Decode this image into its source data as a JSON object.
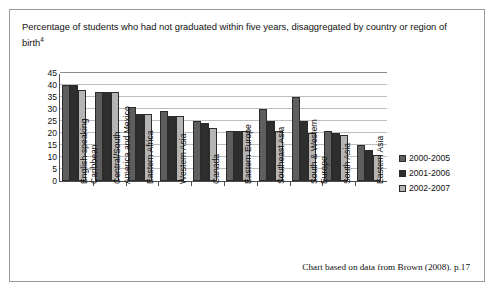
{
  "chart": {
    "title_text": "Percentage of students who had not graduated within five years, disaggregated by country or region of birth",
    "title_superscript": "4",
    "footer": "Chart based on data from Brown (2008). p.17"
  },
  "chart_data": {
    "type": "bar",
    "title": "Percentage of students who had not graduated within five years, disaggregated by country or region of birth",
    "xlabel": "",
    "ylabel": "",
    "ylim": [
      0,
      45
    ],
    "yticks": [
      0,
      5,
      10,
      15,
      20,
      25,
      30,
      35,
      40,
      45
    ],
    "grid": true,
    "legend_position": "right",
    "categories": [
      "English-speaking Caribbean",
      "Central/South America and Mexico",
      "Eastern Africa",
      "Western Asia",
      "Canada",
      "Eastern Europe",
      "Southeast Asia",
      "South & Western Europe",
      "South Asia",
      "Eastern Asia"
    ],
    "category_lines": [
      [
        "English-speaking",
        "Caribbean"
      ],
      [
        "Central/South",
        "America and Mexico"
      ],
      [
        "Eastern Africa",
        ""
      ],
      [
        "Western Asia",
        ""
      ],
      [
        "Canada",
        ""
      ],
      [
        "Eastern Europe",
        ""
      ],
      [
        "Southeast Asia",
        ""
      ],
      [
        "South & Western",
        "Europe"
      ],
      [
        "South Asia",
        ""
      ],
      [
        "Eastern Asia",
        ""
      ]
    ],
    "series": [
      {
        "name": "2000-2005",
        "color": "#5e5e5e",
        "values": [
          40,
          37,
          31,
          29,
          25,
          21,
          30,
          35,
          21,
          15
        ]
      },
      {
        "name": "2001-2006",
        "color": "#2e2e2e",
        "values": [
          40,
          37,
          28,
          27,
          24,
          21,
          25,
          25,
          20,
          13
        ]
      },
      {
        "name": "2002-2007",
        "color": "#b5b5b5",
        "values": [
          38,
          37,
          28,
          27,
          22,
          21,
          21,
          20,
          19,
          11
        ]
      }
    ]
  }
}
